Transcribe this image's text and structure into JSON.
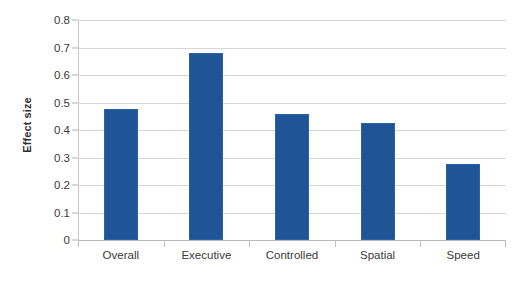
{
  "chart_data": {
    "type": "bar",
    "title": "",
    "subtitle": "",
    "xlabel": "",
    "ylabel": "Effect size",
    "categories": [
      "Overall",
      "Executive",
      "Controlled",
      "Spatial",
      "Speed"
    ],
    "values": [
      0.478,
      0.68,
      0.46,
      0.425,
      0.275
    ],
    "series": [
      {
        "name": "Effect size",
        "values": [
          0.478,
          0.68,
          0.46,
          0.425,
          0.275
        ]
      }
    ],
    "ylim": [
      0,
      0.8
    ],
    "ytick_labels": [
      "0",
      "0.1",
      "0.2",
      "0.3",
      "0.4",
      "0.5",
      "0.6",
      "0.7",
      "0.8"
    ],
    "ytick_values": [
      0,
      0.1,
      0.2,
      0.3,
      0.4,
      0.5,
      0.6,
      0.7,
      0.8
    ],
    "grid": "horizontal",
    "legend": "none",
    "bar_color": "#1f5596",
    "bar_border_color": "#2a63a8",
    "gridline_color": "#d6d6d6",
    "axis_color": "#c8c8c8",
    "background_color": "#ffffff",
    "text_color": "#3a3a3a"
  }
}
